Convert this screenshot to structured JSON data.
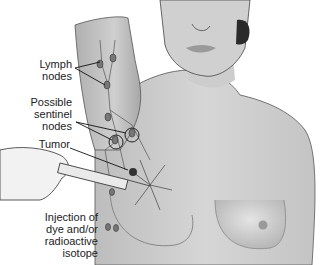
{
  "figure": {
    "labels": {
      "lymph_nodes": "Lymph\nnodes",
      "sentinel_nodes": "Possible\nsentinel\nnodes",
      "tumor": "Tumor",
      "injection": "Injection of\ndye and/or\nradioactive\nisotope"
    },
    "colors": {
      "skin": "#c8c8c8",
      "skin_light": "#e2e2e2",
      "skin_dark": "#8a8a8a",
      "outline": "#333333",
      "hair": "#2a2a2a",
      "node": "#777777",
      "background": "#ffffff"
    }
  }
}
